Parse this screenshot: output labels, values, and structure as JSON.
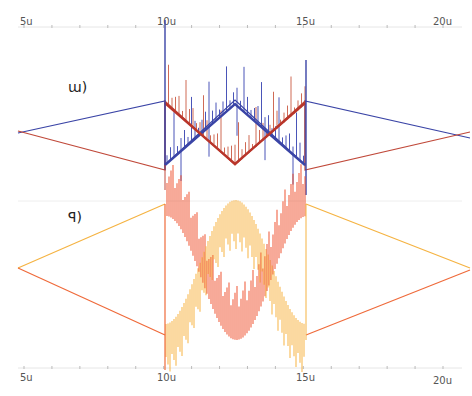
{
  "chart_data": [
    {
      "type": "line",
      "title": "",
      "panel_label": "ɯ)",
      "xlabel": "",
      "ylabel": "",
      "x_ticks": [
        "5u",
        "10u",
        "15u",
        "20u"
      ],
      "x_tick_values": [
        5,
        10,
        15,
        20
      ],
      "xlim": [
        4.6,
        20.6
      ],
      "grid": false,
      "legend": null,
      "series": [
        {
          "name": "blue",
          "color": "#3a44a6",
          "description": "triangle wave; linear outside 10u-15u, ramp up 10u-12.5u then down 12.5u-15u with dense high-frequency spikes",
          "x": [
            4.6,
            10,
            12.5,
            15,
            20.6
          ],
          "y": [
            -0.1,
            0.8,
            0.8,
            -0.8,
            -0.1
          ]
        },
        {
          "name": "red",
          "color": "#c0493a",
          "description": "complementary triangle wave with spikes in 10u-15u",
          "x": [
            4.6,
            10,
            12.5,
            15,
            20.6
          ],
          "y": [
            0.1,
            -0.8,
            -0.8,
            0.8,
            0.1
          ]
        }
      ]
    },
    {
      "type": "line",
      "title": "",
      "panel_label": "ꟼ)",
      "xlabel": "",
      "ylabel": "",
      "x_ticks": [
        "5u",
        "10u",
        "15u",
        "20u"
      ],
      "x_tick_values": [
        5,
        10,
        15,
        20
      ],
      "xlim": [
        4.6,
        20.6
      ],
      "grid": false,
      "legend": null,
      "series": [
        {
          "name": "orange",
          "color": "#f5a623",
          "description": "triangle outside 10u-15u; sinusoidal envelope with dense oscillation between 10u and 15u",
          "x": [
            4.6,
            10,
            12.5,
            15,
            20.6
          ],
          "y": [
            0.0,
            1.0,
            1.0,
            -1.0,
            0.0
          ]
        },
        {
          "name": "red-orange",
          "color": "#ef4b2a",
          "description": "complementary sinusoidal envelope with dense oscillation",
          "x": [
            4.6,
            10,
            12.5,
            15,
            20.6
          ],
          "y": [
            0.0,
            -1.0,
            -1.0,
            1.0,
            0.0
          ]
        }
      ]
    }
  ],
  "axes": {
    "top_ticks": [
      "5u",
      "10u",
      "15u",
      "20u"
    ],
    "bottom_ticks": [
      "5u",
      "10u",
      "15u",
      "20u"
    ]
  },
  "labels": {
    "top_panel": "ɯ)",
    "bottom_panel": "ꟼ)"
  }
}
